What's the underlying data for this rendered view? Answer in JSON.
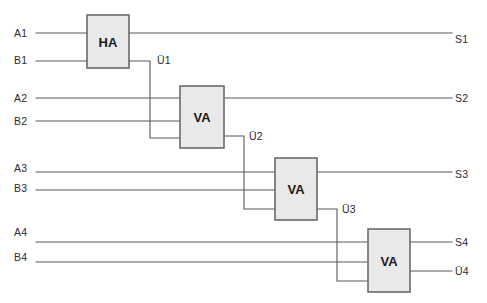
{
  "diagram": {
    "width": 487,
    "height": 303,
    "colors": {
      "background": "#ffffff",
      "wire": "#58585c",
      "block_fill": "#e9e9e9",
      "block_border": "#6a6a6e",
      "text": "#2a2a2e"
    },
    "blocks": [
      {
        "id": "ha1",
        "label": "HA",
        "x": 87,
        "y": 15,
        "width": 42,
        "height": 53
      },
      {
        "id": "va1",
        "label": "VA",
        "x": 180,
        "y": 86,
        "width": 44,
        "height": 62
      },
      {
        "id": "va2",
        "label": "VA",
        "x": 275,
        "y": 158,
        "width": 42,
        "height": 62
      },
      {
        "id": "va3",
        "label": "VA",
        "x": 368,
        "y": 229,
        "width": 42,
        "height": 63
      }
    ],
    "input_labels": [
      {
        "name": "A1",
        "x": 14,
        "y": 28
      },
      {
        "name": "B1",
        "x": 14,
        "y": 55
      },
      {
        "name": "A2",
        "x": 14,
        "y": 93
      },
      {
        "name": "B2",
        "x": 14,
        "y": 116
      },
      {
        "name": "A3",
        "x": 14,
        "y": 163
      },
      {
        "name": "B3",
        "x": 14,
        "y": 183
      },
      {
        "name": "A4",
        "x": 14,
        "y": 227
      },
      {
        "name": "B4",
        "x": 14,
        "y": 252
      }
    ],
    "output_labels": [
      {
        "name": "S1",
        "x": 455,
        "y": 34
      },
      {
        "name": "S2",
        "x": 455,
        "y": 93
      },
      {
        "name": "S3",
        "x": 455,
        "y": 169
      },
      {
        "name": "S4",
        "x": 455,
        "y": 237
      },
      {
        "name": "Ü4",
        "x": 455,
        "y": 266
      }
    ],
    "carry_labels": [
      {
        "name": "Ü1",
        "x": 157,
        "y": 55
      },
      {
        "name": "Ü2",
        "x": 249,
        "y": 131
      },
      {
        "name": "Ü3",
        "x": 342,
        "y": 204
      }
    ],
    "wires": [
      {
        "id": "a1-in",
        "points": "36,33 87,33"
      },
      {
        "id": "b1-in",
        "points": "36,61 87,61"
      },
      {
        "id": "s1-out",
        "points": "129,33 452,33"
      },
      {
        "id": "u1-carry",
        "points": "129,61 150,61 150,138 180,138"
      },
      {
        "id": "a2-in",
        "points": "36,98 180,98"
      },
      {
        "id": "b2-in",
        "points": "36,121 180,121"
      },
      {
        "id": "s2-out",
        "points": "224,98 452,98"
      },
      {
        "id": "u2-carry",
        "points": "224,136 244,136 244,209 275,209"
      },
      {
        "id": "a3-in",
        "points": "36,172 275,172"
      },
      {
        "id": "b3-in",
        "points": "36,190 275,190"
      },
      {
        "id": "s3-out",
        "points": "317,172 452,172"
      },
      {
        "id": "u3-carry",
        "points": "317,209 337,209 337,281 368,281"
      },
      {
        "id": "a4-in",
        "points": "36,242 368,242"
      },
      {
        "id": "b4-in",
        "points": "36,262 368,262"
      },
      {
        "id": "s4-out",
        "points": "410,242 452,242"
      },
      {
        "id": "u4-out",
        "points": "410,271 452,271"
      }
    ]
  }
}
